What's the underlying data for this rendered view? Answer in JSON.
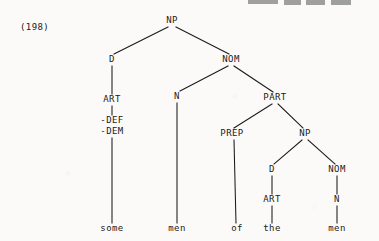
{
  "figure": {
    "example_number": "(198)",
    "type": "syntactic-tree",
    "sentence": "some men of the men",
    "ink_color": "#1a1a1a",
    "page_color": "#fbfaf9"
  },
  "nodes": [
    {
      "id": "np-root",
      "label": "NP",
      "x": 172,
      "y": 24
    },
    {
      "id": "d-outer",
      "label": "D",
      "x": 112,
      "y": 63
    },
    {
      "id": "nom-outer",
      "label": "NOM",
      "x": 231,
      "y": 63
    },
    {
      "id": "art-outer",
      "label": "ART",
      "x": 112,
      "y": 103
    },
    {
      "id": "n-outer",
      "label": "N",
      "x": 177,
      "y": 100
    },
    {
      "id": "part",
      "label": "PART",
      "x": 275,
      "y": 101
    },
    {
      "id": "prep",
      "label": "PREP",
      "x": 232,
      "y": 137
    },
    {
      "id": "np-inner",
      "label": "NP",
      "x": 305,
      "y": 137
    },
    {
      "id": "d-inner",
      "label": "D",
      "x": 272,
      "y": 173
    },
    {
      "id": "nom-inner",
      "label": "NOM",
      "x": 337,
      "y": 173
    },
    {
      "id": "art-inner",
      "label": "ART",
      "x": 272,
      "y": 203
    },
    {
      "id": "n-inner",
      "label": "N",
      "x": 337,
      "y": 203
    }
  ],
  "features": {
    "id": "art-outer-features",
    "lines": [
      "-DEF",
      "-DEM"
    ],
    "x": 112,
    "y": 124
  },
  "leaves": [
    {
      "id": "leaf-some",
      "label": "some",
      "x": 112,
      "y": 232
    },
    {
      "id": "leaf-men1",
      "label": "men",
      "x": 177,
      "y": 232
    },
    {
      "id": "leaf-of",
      "label": "of",
      "x": 237,
      "y": 232
    },
    {
      "id": "leaf-the",
      "label": "the",
      "x": 272,
      "y": 232
    },
    {
      "id": "leaf-men2",
      "label": "men",
      "x": 337,
      "y": 232
    }
  ],
  "edges": [
    {
      "from": "np-root",
      "to": "d-outer",
      "x1": 168,
      "y1": 27,
      "x2": 114,
      "y2": 54
    },
    {
      "from": "np-root",
      "to": "nom-outer",
      "x1": 176,
      "y1": 27,
      "x2": 229,
      "y2": 54
    },
    {
      "from": "d-outer",
      "to": "art-outer",
      "x1": 112,
      "y1": 66,
      "x2": 112,
      "y2": 94
    },
    {
      "from": "nom-outer",
      "to": "n-outer",
      "x1": 228,
      "y1": 66,
      "x2": 180,
      "y2": 91
    },
    {
      "from": "nom-outer",
      "to": "part",
      "x1": 234,
      "y1": 66,
      "x2": 273,
      "y2": 92
    },
    {
      "from": "art-outer",
      "to": "features",
      "x1": 112,
      "y1": 106,
      "x2": 112,
      "y2": 115
    },
    {
      "from": "part",
      "to": "prep",
      "x1": 272,
      "y1": 104,
      "x2": 234,
      "y2": 128
    },
    {
      "from": "part",
      "to": "np-inner",
      "x1": 278,
      "y1": 104,
      "x2": 303,
      "y2": 128
    },
    {
      "from": "np-inner",
      "to": "d-inner",
      "x1": 302,
      "y1": 140,
      "x2": 274,
      "y2": 164
    },
    {
      "from": "np-inner",
      "to": "nom-inner",
      "x1": 308,
      "y1": 140,
      "x2": 335,
      "y2": 164
    },
    {
      "from": "d-inner",
      "to": "art-inner",
      "x1": 272,
      "y1": 176,
      "x2": 272,
      "y2": 194
    },
    {
      "from": "nom-inner",
      "to": "n-inner",
      "x1": 337,
      "y1": 176,
      "x2": 337,
      "y2": 194
    },
    {
      "from": "features",
      "to": "leaf-some",
      "x1": 112,
      "y1": 138,
      "x2": 112,
      "y2": 223
    },
    {
      "from": "n-outer",
      "to": "leaf-men1",
      "x1": 177,
      "y1": 103,
      "x2": 177,
      "y2": 223
    },
    {
      "from": "prep",
      "to": "leaf-of",
      "x1": 234,
      "y1": 140,
      "x2": 236,
      "y2": 223
    },
    {
      "from": "art-inner",
      "to": "leaf-the",
      "x1": 272,
      "y1": 206,
      "x2": 272,
      "y2": 223
    },
    {
      "from": "n-inner",
      "to": "leaf-men2",
      "x1": 337,
      "y1": 206,
      "x2": 337,
      "y2": 223
    }
  ],
  "clip_artifacts": [
    {
      "x": 248,
      "y": 0,
      "w": 30,
      "h": 4
    },
    {
      "x": 284,
      "y": 0,
      "w": 17,
      "h": 5
    },
    {
      "x": 306,
      "y": 0,
      "w": 19,
      "h": 5
    },
    {
      "x": 331,
      "y": 0,
      "w": 20,
      "h": 5
    }
  ]
}
